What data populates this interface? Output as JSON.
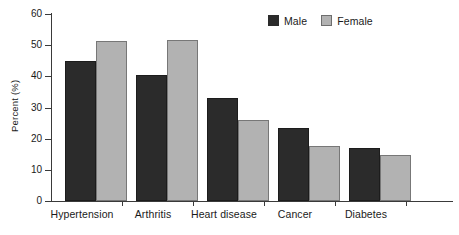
{
  "chart_data": {
    "type": "bar",
    "title": "",
    "xlabel": "",
    "ylabel": "Percent (%)",
    "ylim": [
      0,
      60
    ],
    "yticks": [
      0,
      10,
      20,
      30,
      40,
      50,
      60
    ],
    "grid": false,
    "legend_position": "top-right",
    "categories": [
      "Hypertension",
      "Arthritis",
      "Heart disease",
      "Cancer",
      "Diabetes"
    ],
    "series": [
      {
        "name": "Male",
        "color": "#2b2b2b",
        "values": [
          44.9,
          40.5,
          33.0,
          23.4,
          17.0
        ]
      },
      {
        "name": "Female",
        "color": "#b2b2b2",
        "values": [
          51.3,
          51.6,
          26.0,
          17.6,
          14.8
        ]
      }
    ]
  },
  "axis": {
    "tick_0": "0",
    "tick_10": "10",
    "tick_20": "20",
    "tick_30": "30",
    "tick_40": "40",
    "tick_50": "50",
    "tick_60": "60"
  }
}
